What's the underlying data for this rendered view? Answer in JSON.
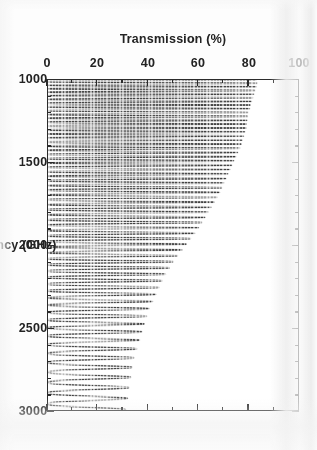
{
  "figure": {
    "rotation_degrees": 90,
    "background_color": "#fdfdfd",
    "frame_color": "#2b2b2b",
    "curve_color": "#3a3a3a"
  },
  "chart_data": {
    "type": "line",
    "title": "",
    "xlabel": "Frequency (GHz)",
    "ylabel": "Transmission (%)",
    "xlim": [
      1000,
      3000
    ],
    "ylim": [
      0,
      100
    ],
    "xticks": [
      1000,
      1500,
      2000,
      2500,
      3000
    ],
    "xticklabels": [
      "1000",
      "1500",
      "2000",
      "2500",
      "3000"
    ],
    "yticks": [
      0,
      20,
      40,
      60,
      80,
      100
    ],
    "yticklabels": [
      "0",
      "20",
      "40",
      "60",
      "80",
      "100"
    ],
    "x_minor_tick_step": 100,
    "y_minor_tick_step": 10,
    "grid": false,
    "legend": null,
    "series": [
      {
        "name": "Transmission",
        "description": "Dense Fabry-Perot fringe spectrum; minima touch 0%, envelope of maxima decays from ~84% near 1000 GHz to ~30% near 3000 GHz; fringe spacing widens with frequency.",
        "envelope_x": [
          1000,
          1100,
          1200,
          1300,
          1400,
          1500,
          1600,
          1700,
          1800,
          1900,
          2000,
          2100,
          2200,
          2300,
          2400,
          2500,
          2600,
          2700,
          2800,
          2900,
          3000
        ],
        "envelope_max": [
          84,
          82,
          80,
          79,
          77,
          74,
          71,
          68,
          64,
          60,
          55,
          50,
          46,
          43,
          40,
          38,
          36,
          34,
          33,
          32,
          31
        ],
        "envelope_min": [
          0,
          0,
          0,
          0,
          0,
          0,
          0,
          0,
          0,
          0,
          0,
          0,
          0,
          0,
          0,
          0,
          0,
          0,
          0,
          0,
          0
        ],
        "fringe_period_x": [
          1000,
          1500,
          2000,
          2500,
          3000
        ],
        "fringe_period_values": [
          21,
          26,
          34,
          48,
          70
        ]
      }
    ]
  }
}
